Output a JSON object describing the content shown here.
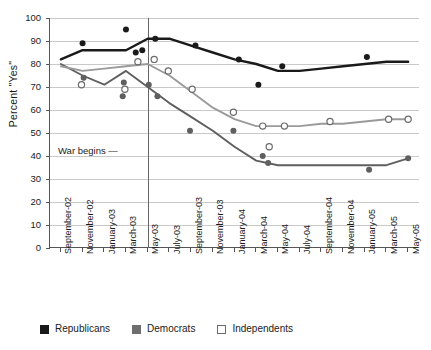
{
  "chart_data": {
    "type": "line",
    "title": "",
    "xlabel": "",
    "ylabel": "Percent \"Yes\"",
    "ylim": [
      0,
      100
    ],
    "ytick_step": 10,
    "grid": true,
    "legend_position": "bottom-left",
    "yticks": [
      0,
      10,
      20,
      30,
      40,
      50,
      60,
      70,
      80,
      90,
      100
    ],
    "categories": [
      "September-02",
      "November-02",
      "January-03",
      "March-03",
      "May-03",
      "July-03",
      "September-03",
      "November-03",
      "January-04",
      "March-04",
      "May-04",
      "July-04",
      "September-04",
      "November-04",
      "January-05",
      "March-05",
      "May-05"
    ],
    "annotations": [
      {
        "text": "War begins",
        "dash": "—",
        "at_category": "March-03",
        "x_index": 4.0
      }
    ],
    "series": [
      {
        "name": "Republicans",
        "color": "#1a1a1a",
        "marker": "filled-circle",
        "line_x": [
          0,
          1,
          2,
          3,
          4,
          5,
          6,
          7,
          8,
          9,
          10,
          11,
          12,
          13,
          14,
          15,
          16
        ],
        "values": [
          82,
          86,
          86,
          86,
          91,
          91,
          88,
          85,
          82,
          80,
          77,
          77,
          78,
          79,
          80,
          81,
          81
        ],
        "extra_points": [
          {
            "x": 1,
            "y": 89
          },
          {
            "x": 3,
            "y": 95
          },
          {
            "x": 3.45,
            "y": 85
          },
          {
            "x": 3.75,
            "y": 86
          },
          {
            "x": 4.35,
            "y": 91
          },
          {
            "x": 6.2,
            "y": 88
          },
          {
            "x": 8.2,
            "y": 82
          },
          {
            "x": 9.1,
            "y": 71
          },
          {
            "x": 10.2,
            "y": 79
          },
          {
            "x": 14.1,
            "y": 83
          }
        ]
      },
      {
        "name": "Democrats",
        "color": "#5f5f5f",
        "marker": "filled-circle",
        "line_x": [
          0,
          1,
          2,
          3,
          4,
          5,
          6,
          7,
          8,
          9,
          10,
          11,
          12,
          13,
          14,
          15,
          16
        ],
        "values": [
          80,
          75,
          71,
          77,
          70,
          63,
          57,
          51,
          44,
          38,
          36,
          36,
          36,
          36,
          36,
          36,
          39
        ],
        "extra_points": [
          {
            "x": 1.05,
            "y": 74
          },
          {
            "x": 2.85,
            "y": 66
          },
          {
            "x": 2.9,
            "y": 72
          },
          {
            "x": 4.05,
            "y": 71
          },
          {
            "x": 4.45,
            "y": 66
          },
          {
            "x": 5.95,
            "y": 51
          },
          {
            "x": 7.95,
            "y": 51
          },
          {
            "x": 9.3,
            "y": 40
          },
          {
            "x": 9.55,
            "y": 37
          },
          {
            "x": 14.2,
            "y": 34
          },
          {
            "x": 16,
            "y": 39
          }
        ]
      },
      {
        "name": "Independents",
        "color": "#9a9a9a",
        "marker": "open-circle",
        "line_x": [
          0,
          1,
          2,
          3,
          4,
          5,
          6,
          7,
          8,
          9,
          10,
          11,
          12,
          13,
          14,
          15,
          16
        ],
        "values": [
          79,
          77,
          78,
          79,
          80,
          75,
          68,
          61,
          56,
          53,
          53,
          53,
          54,
          54,
          55,
          56,
          56
        ],
        "extra_points": [
          {
            "x": 0.95,
            "y": 71
          },
          {
            "x": 2.95,
            "y": 69
          },
          {
            "x": 3.55,
            "y": 81
          },
          {
            "x": 4.3,
            "y": 82
          },
          {
            "x": 4.95,
            "y": 77
          },
          {
            "x": 6.05,
            "y": 69
          },
          {
            "x": 7.95,
            "y": 59
          },
          {
            "x": 9.3,
            "y": 53
          },
          {
            "x": 9.6,
            "y": 44
          },
          {
            "x": 10.3,
            "y": 53
          },
          {
            "x": 12.4,
            "y": 55
          },
          {
            "x": 15.1,
            "y": 56
          },
          {
            "x": 16,
            "y": 56
          }
        ]
      }
    ]
  },
  "legend": {
    "items": [
      {
        "label": "Republicans",
        "swatch": "filled-black-square"
      },
      {
        "label": "Democrats",
        "swatch": "filled-gray-square"
      },
      {
        "label": "Independents",
        "swatch": "open-square"
      }
    ]
  }
}
